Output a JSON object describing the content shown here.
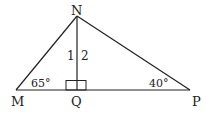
{
  "diagram": {
    "type": "triangle",
    "vertices": {
      "N": {
        "label": "N",
        "x": 77,
        "y": 16
      },
      "M": {
        "label": "M",
        "x": 16,
        "y": 90
      },
      "P": {
        "label": "P",
        "x": 190,
        "y": 90
      },
      "Q": {
        "label": "Q",
        "x": 77,
        "y": 90
      }
    },
    "angle_labels": {
      "angle_M": "65°",
      "angle_P": "40°",
      "angle_1": "1",
      "angle_2": "2"
    },
    "segments": [
      "MN",
      "NP",
      "MP",
      "NQ"
    ],
    "right_angle_at": "Q",
    "stroke_color": "#222222"
  }
}
